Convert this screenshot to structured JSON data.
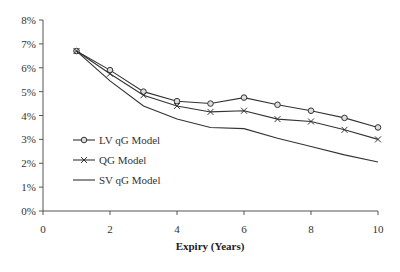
{
  "chart_data": {
    "type": "line",
    "title": "",
    "xlabel": "Expiry (Years)",
    "ylabel": "",
    "x": [
      1,
      2,
      3,
      4,
      5,
      6,
      7,
      8,
      9,
      10
    ],
    "xlim": [
      0,
      10
    ],
    "ylim": [
      0,
      8
    ],
    "x_ticks": [
      "0",
      "2",
      "4",
      "6",
      "8",
      "10"
    ],
    "y_ticks": [
      "0%",
      "1%",
      "2%",
      "3%",
      "4%",
      "5%",
      "6%",
      "7%",
      "8%"
    ],
    "grid": false,
    "legend_position": "inside-left-middle",
    "series": [
      {
        "name": "LV qG Model",
        "marker": "circle",
        "values": [
          6.7,
          5.9,
          5.0,
          4.6,
          4.5,
          4.75,
          4.45,
          4.2,
          3.9,
          3.5
        ]
      },
      {
        "name": "QG Model",
        "marker": "x",
        "values": [
          6.7,
          5.75,
          4.85,
          4.4,
          4.15,
          4.2,
          3.85,
          3.75,
          3.4,
          3.0
        ]
      },
      {
        "name": "SV qG Model",
        "marker": "none",
        "values": [
          6.7,
          5.45,
          4.4,
          3.85,
          3.5,
          3.45,
          3.05,
          2.7,
          2.35,
          2.05
        ]
      }
    ]
  },
  "colors": {
    "line": "#333333",
    "axis": "#555555",
    "background": "#ffffff"
  }
}
